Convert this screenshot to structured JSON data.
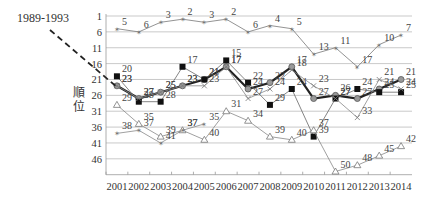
{
  "chart_data": {
    "type": "line",
    "title": "",
    "xlabel": "",
    "ylabel": "順位",
    "annotation": "1989-1993",
    "y_reversed": true,
    "ylim": [
      1,
      51
    ],
    "y_ticks": [
      1,
      6,
      11,
      16,
      21,
      26,
      31,
      36,
      41,
      46
    ],
    "x": [
      "2001",
      "2002",
      "2003",
      "2004",
      "2005",
      "2006",
      "2007",
      "2008",
      "2009",
      "2010",
      "2011",
      "2012",
      "2013",
      "2014"
    ],
    "grid": "horizontal",
    "legend": "none",
    "series": [
      {
        "name": "top-star",
        "marker": "star",
        "color": "#777777",
        "width": 0.8,
        "values": [
          5,
          6,
          3,
          2,
          3,
          2,
          6,
          4,
          5,
          13,
          11,
          17,
          10,
          7
        ]
      },
      {
        "name": "thick-line",
        "marker": "circle",
        "color": "#222222",
        "width": 2.2,
        "values": [
          23,
          27,
          25,
          23,
          21,
          17,
          24,
          22,
          17,
          27,
          26,
          27,
          24,
          21
        ]
      },
      {
        "name": "square",
        "marker": "square",
        "color": "#666666",
        "width": 0.8,
        "values": [
          20,
          28,
          28,
          17,
          21,
          15,
          22,
          29,
          24,
          39,
          27,
          24,
          25,
          25
        ]
      },
      {
        "name": "x-mark",
        "marker": "x",
        "color": "#888888",
        "width": 0.8,
        "values": [
          23,
          27,
          25,
          23,
          23,
          17,
          27,
          24,
          18,
          23,
          27,
          33,
          21,
          24
        ]
      },
      {
        "name": "triangle",
        "marker": "triangle",
        "color": "#888888",
        "width": 0.8,
        "values": [
          29,
          35,
          39,
          37,
          40,
          31,
          34,
          39,
          40,
          37,
          50,
          48,
          45,
          42
        ]
      },
      {
        "name": "low-star",
        "marker": "star",
        "color": "#888888",
        "width": 0.8,
        "values": [
          38,
          37,
          41,
          37,
          35,
          null,
          null,
          null,
          null,
          null,
          null,
          null,
          null,
          null
        ]
      }
    ]
  }
}
